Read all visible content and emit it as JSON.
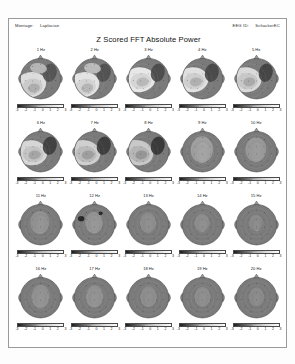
{
  "header": {
    "montage_key": "Montage:",
    "montage_value": "Laplacian",
    "eegid_key": "EEG ID:",
    "eegid_value": "SchackerEC"
  },
  "title": "Z Scored FFT Absolute Power",
  "colorbar": {
    "label": "Z Score",
    "ticks": [
      "-3",
      "-2",
      "-1",
      "0",
      "1",
      "2",
      "3"
    ],
    "min": -3,
    "max": 3,
    "low_color": "#1d1d1d",
    "high_color": "#fbfbfb"
  },
  "chart_data": {
    "type": "heatmap",
    "title": "Z Scored FFT Absolute Power",
    "subtitle": "EEG topographic scalp maps, Laplacian montage",
    "xlabel": "",
    "ylabel": "",
    "grid": false,
    "legend": "colorbar below each map",
    "zlim": [
      -3,
      3
    ],
    "zlabel": "Z Score",
    "rows": 4,
    "cols": 5,
    "panels": [
      {
        "label": "1 Hz",
        "frequency_hz": 1,
        "z_range": [
          -3,
          3
        ],
        "pattern": "bilateral posterior-temporal elevation, mixed frontal",
        "peak_z": 2.4
      },
      {
        "label": "2 Hz",
        "frequency_hz": 2,
        "z_range": [
          -3,
          3
        ],
        "pattern": "left frontotemporal band of elevation",
        "peak_z": 2.6
      },
      {
        "label": "3 Hz",
        "frequency_hz": 3,
        "z_range": [
          -3,
          3
        ],
        "pattern": "broad left hemisphere elevation",
        "peak_z": 2.7
      },
      {
        "label": "4 Hz",
        "frequency_hz": 4,
        "z_range": [
          -3,
          3
        ],
        "pattern": "left central ring of elevation",
        "peak_z": 2.5
      },
      {
        "label": "5 Hz",
        "frequency_hz": 5,
        "z_range": [
          -3,
          3
        ],
        "pattern": "left frontocentral elevation",
        "peak_z": 2.3
      },
      {
        "label": "6 Hz",
        "frequency_hz": 6,
        "z_range": [
          -3,
          3
        ],
        "pattern": "wide left temporal-central elevation",
        "peak_z": 2.2
      },
      {
        "label": "7 Hz",
        "frequency_hz": 7,
        "z_range": [
          -3,
          3
        ],
        "pattern": "left posterior elevation, frontal ring",
        "peak_z": 2.0
      },
      {
        "label": "8 Hz",
        "frequency_hz": 8,
        "z_range": [
          -3,
          3
        ],
        "pattern": "left posterior-temporal elevation",
        "peak_z": 1.8
      },
      {
        "label": "9 Hz",
        "frequency_hz": 9,
        "z_range": [
          -3,
          3
        ],
        "pattern": "central midline focus, reduced extent",
        "peak_z": 1.4
      },
      {
        "label": "10 Hz",
        "frequency_hz": 10,
        "z_range": [
          -3,
          3
        ],
        "pattern": "small central midline focus",
        "peak_z": 1.2
      },
      {
        "label": "11 Hz",
        "frequency_hz": 11,
        "z_range": [
          -3,
          3
        ],
        "pattern": "narrow central midline focus",
        "peak_z": 1.0
      },
      {
        "label": "12 Hz",
        "frequency_hz": 12,
        "z_range": [
          -3,
          3
        ],
        "pattern": "central midline focus with left temporal low spot",
        "peak_z": 1.1
      },
      {
        "label": "13 Hz",
        "frequency_hz": 13,
        "z_range": [
          -3,
          3
        ],
        "pattern": "central midline focus",
        "peak_z": 0.9
      },
      {
        "label": "14 Hz",
        "frequency_hz": 14,
        "z_range": [
          -3,
          3
        ],
        "pattern": "central midline focus",
        "peak_z": 0.9
      },
      {
        "label": "15 Hz",
        "frequency_hz": 15,
        "z_range": [
          -3,
          3
        ],
        "pattern": "central midline focus",
        "peak_z": 0.8
      },
      {
        "label": "16 Hz",
        "frequency_hz": 16,
        "z_range": [
          -3,
          3
        ],
        "pattern": "small central focus, flat field",
        "peak_z": 0.7
      },
      {
        "label": "17 Hz",
        "frequency_hz": 17,
        "z_range": [
          -3,
          3
        ],
        "pattern": "small central focus, flat field",
        "peak_z": 0.7
      },
      {
        "label": "18 Hz",
        "frequency_hz": 18,
        "z_range": [
          -3,
          3
        ],
        "pattern": "small central focus, flat field",
        "peak_z": 0.6
      },
      {
        "label": "19 Hz",
        "frequency_hz": 19,
        "z_range": [
          -3,
          3
        ],
        "pattern": "small central focus, flat field",
        "peak_z": 0.6
      },
      {
        "label": "20 Hz",
        "frequency_hz": 20,
        "z_range": [
          -3,
          3
        ],
        "pattern": "small central focus, flat field",
        "peak_z": 0.5
      }
    ]
  }
}
